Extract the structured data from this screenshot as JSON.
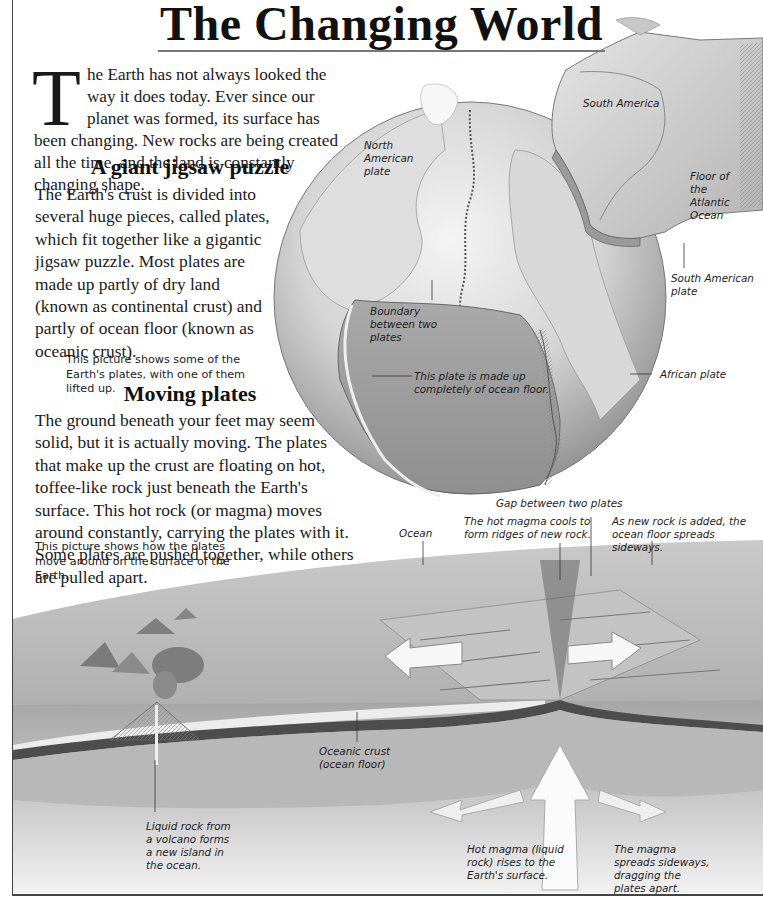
{
  "page": {
    "title": "The Changing World",
    "intro": {
      "dropcap": "T",
      "text": "he Earth has not always looked the way it does today. Ever since our planet was formed, its surface has been changing. New rocks are being created all the time, and the land is constantly changing shape."
    },
    "sections": [
      {
        "heading": "A giant jigsaw puzzle",
        "body": "The Earth's crust is divided into several huge pieces, called plates, which fit together like a gigantic jigsaw puzzle. Most plates are made up partly of dry land (known as continental crust) and partly of ocean floor (known as oceanic crust).",
        "caption": "This picture shows some of the Earth's plates, with one of them lifted up."
      },
      {
        "heading": "Moving plates",
        "body": "The ground beneath your feet may seem solid, but it is actually moving. The plates that make up the crust are floating on hot, toffee-like rock just beneath the Earth's surface. This hot rock (or magma) moves around constantly, carrying the plates with it. Some plates are pushed together, while others are pulled apart.",
        "caption": "This picture shows how the plates move around on the surface of the Earth."
      }
    ],
    "globe_labels": {
      "south_america": "South America",
      "north_american_plate": "North American plate",
      "floor_atlantic": "Floor of the Atlantic Ocean",
      "south_american_plate": "South American plate",
      "boundary": "Boundary between two plates",
      "ocean_floor_plate": "This plate is made up completely of ocean floor.",
      "african_plate": "African plate"
    },
    "cross_section_labels": {
      "gap": "Gap between two plates",
      "ocean": "Ocean",
      "ridges": "The hot magma cools to form ridges of new rock.",
      "spreads": "As new rock is added, the ocean floor spreads sideways.",
      "oceanic_crust": "Oceanic crust (ocean floor)",
      "volcano": "Liquid rock from a volcano forms a new island in the ocean.",
      "hot_magma": "Hot magma (liquid rock) rises to the Earth's surface.",
      "magma_spreads": "The magma spreads sideways, dragging the plates apart."
    }
  }
}
